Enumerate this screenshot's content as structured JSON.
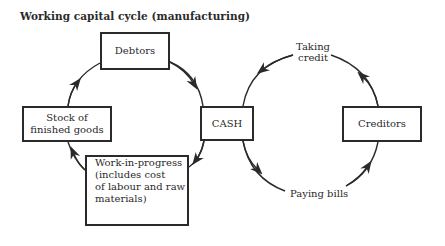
{
  "title": "Working capital cycle (manufacturing)",
  "nodes": {
    "debtors": "Debtors",
    "stock": "Stock of finished goods",
    "cash": "CASH",
    "creditors": "Creditors",
    "wip": "Work-in-progress (includes cost of labour and raw materials)"
  },
  "node_lines": {
    "stock": [
      "Stock of",
      "finished goods"
    ],
    "wip": [
      "Work-in-progress",
      "(includes cost",
      "of labour and raw",
      "materials)"
    ]
  },
  "edge_labels": {
    "taking_credit": [
      "Taking",
      "credit"
    ],
    "paying_bills": "Paying bills"
  },
  "cycles": [
    {
      "name": "manufacturing cycle",
      "flow": [
        "Stock of finished goods",
        "Debtors",
        "CASH",
        "Work-in-progress",
        "Stock of finished goods"
      ]
    },
    {
      "name": "credit cycle",
      "flow": [
        "CASH",
        "Paying bills",
        "Creditors",
        "Taking credit",
        "CASH"
      ]
    }
  ],
  "colors": {
    "ink": "#2a2a2a",
    "background": "#ffffff"
  }
}
